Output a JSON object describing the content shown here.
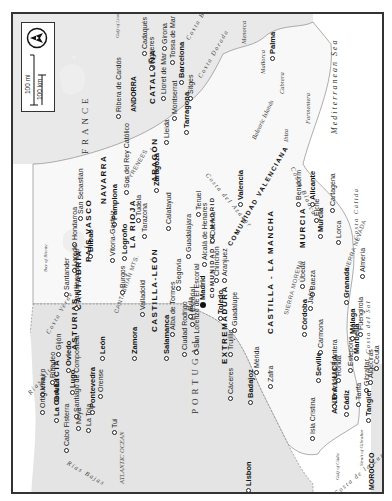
{
  "map": {
    "title": "Spain (rotated, north to the left)",
    "orientation": "north-left",
    "colors": {
      "land_other": "#e6e6e6",
      "land_spain": "#f7f7f7",
      "sea": "#ffffff",
      "border": "#333333"
    },
    "legend": {
      "compass_icon": "north-arrow-icon",
      "scale_mi": "100 mi",
      "scale_km": "100 km",
      "scale_zero_mi": "0",
      "scale_zero_km": "0"
    },
    "countries": [
      "FRANCE",
      "PORTUGAL",
      "MOROCCO",
      "ANDORRA"
    ],
    "seas": {
      "mediterranean": "Mediterranean Sea",
      "atlantic": "ATLANTIC OCEAN",
      "biscay": "Bay of Biscay",
      "lions": "Gulf of Lions",
      "cadiz": "Gulf of Cádiz",
      "gibraltar_strait": "Strait of Gibraltar",
      "balearic": "Balearic Islands"
    },
    "regions": [
      "CATALUÑA",
      "ARAGÓN",
      "NAVARRA",
      "PAÍS VASCO",
      "LA RIOJA",
      "CANTABRIA",
      "ASTURIAS",
      "GALICIA",
      "CASTILLA-LEÓN",
      "COMUNIDAD DE MADRID",
      "CASTILLA - LA MANCHA",
      "EXTREMADURA",
      "ANDALUCÍA",
      "MURCIA",
      "COMUNIDAD VALENCIANA"
    ],
    "mountains": [
      "PYRENEES",
      "CANTABRIAN MTS.",
      "SIERRA MORENA",
      "SIERRA NEVADA"
    ],
    "coasts": [
      "Costa Brava",
      "Costa Dorada",
      "Costa del Azahar",
      "Costa Blanca",
      "Costa Cálida",
      "Costa del Sol",
      "Costa de la Luz",
      "Costa Verde",
      "Rías Altas",
      "Rías Bajas"
    ],
    "islands": [
      "Menorca",
      "Mallorca",
      "Cabrera",
      "Ibiza",
      "Formentera"
    ],
    "cities": [
      "Cadaqués",
      "Figueres",
      "Girona",
      "Tossa de Mar",
      "Lloret de Mar",
      "Barcelona",
      "Sitges",
      "Montserrat",
      "Tarragona",
      "Lleida",
      "Ribera de Cardós",
      "Palma",
      "Zaragoza",
      "Sos del Rey Católico",
      "Tudela",
      "Pamplona",
      "San Sebastián",
      "Hondarroa",
      "Bilbao",
      "Laredo",
      "Santander",
      "Santillana del Mar",
      "Vitoria-Gasteiz",
      "Logroño",
      "Tarazona",
      "Calatayud",
      "Burgos",
      "Valladolid",
      "Guadalajara",
      "Alcalá de Henares",
      "Segovia",
      "Madrid",
      "Chinchón",
      "Aranjuez",
      "Cuenca",
      "Teruel",
      "Valencia",
      "Benidorm",
      "Alicante",
      "Elche",
      "Murcia",
      "Cartagena",
      "Lorca",
      "Almería",
      "Granada",
      "Úbeda",
      "Baeza",
      "Jaén",
      "Toledo",
      "Guadalupe",
      "El Escorial",
      "Ávila",
      "Alba de Tormes",
      "Zamora",
      "León",
      "Oviedo",
      "Gijón",
      "Ribadeo",
      "Viveiro",
      "Ortigueira",
      "La Coruña",
      "Lugo",
      "Santiago de Compostela",
      "Noya",
      "La Toja",
      "Pontevedra",
      "Orense",
      "Tui",
      "Cabo Fisterra",
      "Salamanca",
      "Ciudad Rodrigo",
      "San Lorenzo de El Escorial",
      "Cáceres",
      "Trujillo",
      "Mérida",
      "Badajoz",
      "Zafra",
      "Córdoba",
      "Carmona",
      "Seville",
      "Jerez de la Frontera",
      "Cádiz",
      "Isla Cristina",
      "Ronda",
      "Estepona",
      "Marbella",
      "Málaga",
      "Fuengirola",
      "Tarifa",
      "Gibraltar",
      "Algeciras",
      "Ceuta",
      "Tangier",
      "Lisbon"
    ]
  }
}
